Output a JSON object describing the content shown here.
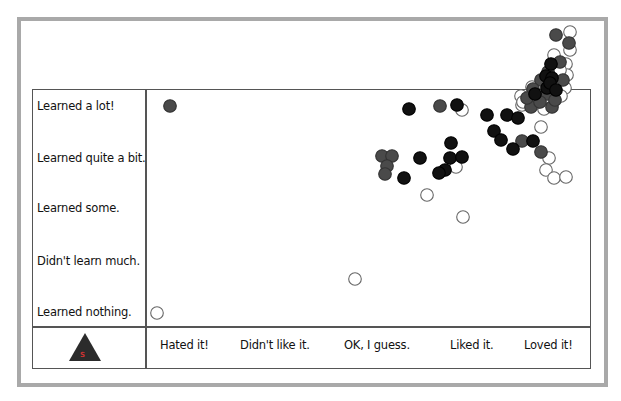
{
  "y_labels": [
    "Learned a lot!",
    "Learned quite a bit.",
    "Learned some.",
    "Didn't learn much.",
    "Learned nothing."
  ],
  "x_labels": [
    "Hated it!",
    "Didn't like it.",
    "OK, I guess.",
    "Liked it.",
    "Loved it!"
  ],
  "logo": {
    "icon": "triangle-logo-icon",
    "mark": "S"
  },
  "colors": {
    "dark_gray": "#4a4a4a",
    "black": "#111111",
    "open_stroke": "#666666",
    "frame": "#a9a9a9",
    "grid": "#555555"
  },
  "chart_data": {
    "type": "scatter",
    "title": "",
    "xlabel": "Enjoyment",
    "ylabel": "Learning",
    "x_categories": [
      "Hated it!",
      "Didn't like it.",
      "OK, I guess.",
      "Liked it.",
      "Loved it!"
    ],
    "y_categories": [
      "Learned nothing.",
      "Didn't learn much.",
      "Learned some.",
      "Learned quite a bit.",
      "Learned a lot!"
    ],
    "grid": false,
    "legend": "none",
    "series": [
      {
        "name": "dark-gray",
        "style": "filled #4a4a4a",
        "points_px": [
          [
            170,
            106
          ],
          [
            440,
            106
          ],
          [
            382,
            156
          ],
          [
            392,
            156
          ],
          [
            387,
            166
          ],
          [
            385,
            174
          ],
          [
            522,
            141
          ],
          [
            541,
            152
          ],
          [
            531,
            107
          ],
          [
            552,
            107
          ],
          [
            556,
            35
          ],
          [
            569,
            43
          ],
          [
            560,
            62
          ],
          [
            548,
            72
          ],
          [
            541,
            80
          ],
          [
            563,
            80
          ],
          [
            533,
            89
          ],
          [
            547,
            94
          ],
          [
            527,
            98
          ],
          [
            540,
            102
          ],
          [
            555,
            100
          ]
        ]
      },
      {
        "name": "black",
        "style": "filled #111111",
        "points_px": [
          [
            409,
            109
          ],
          [
            457,
            105
          ],
          [
            487,
            115
          ],
          [
            507,
            115
          ],
          [
            518,
            118
          ],
          [
            451,
            143
          ],
          [
            420,
            158
          ],
          [
            450,
            158
          ],
          [
            462,
            157
          ],
          [
            445,
            170
          ],
          [
            439,
            173
          ],
          [
            404,
            178
          ],
          [
            494,
            131
          ],
          [
            501,
            140
          ],
          [
            513,
            149
          ],
          [
            533,
            141
          ],
          [
            551,
            64
          ],
          [
            546,
            76
          ],
          [
            552,
            78
          ],
          [
            547,
            88
          ],
          [
            550,
            83
          ],
          [
            556,
            90
          ],
          [
            535,
            94
          ]
        ]
      },
      {
        "name": "open",
        "style": "white fill, gray stroke",
        "points_px": [
          [
            157,
            313
          ],
          [
            355,
            279
          ],
          [
            427,
            195
          ],
          [
            463,
            217
          ],
          [
            462,
            110
          ],
          [
            456,
            167
          ],
          [
            522,
            105
          ],
          [
            541,
            127
          ],
          [
            549,
            158
          ],
          [
            546,
            170
          ],
          [
            554,
            178
          ],
          [
            566,
            177
          ],
          [
            570,
            32
          ],
          [
            570,
            50
          ],
          [
            566,
            64
          ],
          [
            567,
            75
          ],
          [
            560,
            70
          ],
          [
            554,
            55
          ],
          [
            532,
            87
          ],
          [
            521,
            96
          ],
          [
            523,
            102
          ],
          [
            565,
            88
          ],
          [
            561,
            96
          ],
          [
            544,
            109
          ],
          [
            536,
            103
          ]
        ]
      }
    ]
  }
}
